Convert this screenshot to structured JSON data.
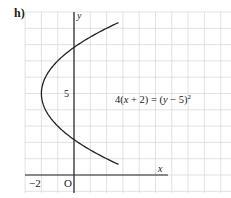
{
  "part_label": "h)",
  "chart_data": {
    "type": "line",
    "title": "",
    "equation": "4(x + 2) = (y − 5)²",
    "equation_parts": {
      "lhs_coeff": "4(",
      "lhs_var": "x",
      "lhs_rest": " + 2) = (",
      "rhs_var": "y",
      "rhs_rest": " − 5)",
      "exponent": "2"
    },
    "xlabel": "x",
    "ylabel": "y",
    "origin_label": "O",
    "x_tick_labels": [
      {
        "value": -2,
        "label": "−2"
      }
    ],
    "y_tick_labels": [
      {
        "value": 5,
        "label": "5"
      }
    ],
    "xlim": [
      -3,
      9.5
    ],
    "ylim": [
      -1,
      10
    ],
    "grid": true,
    "grid_step": 1,
    "curve": {
      "kind": "parabola",
      "opens": "right",
      "vertex": [
        -2,
        5
      ],
      "y_range": [
        0.65,
        9.35
      ],
      "y_intercepts": [
        2.17,
        7.83
      ]
    },
    "colors": {
      "grid": "#d6d6d6",
      "axis": "#222222",
      "curve": "#222222"
    }
  }
}
